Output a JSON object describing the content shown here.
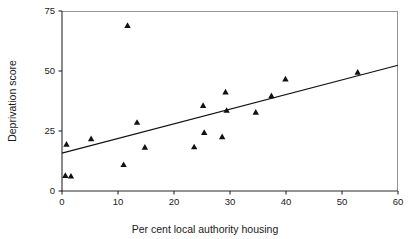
{
  "chart_data": {
    "type": "scatter",
    "title": "",
    "xlabel": "Per cent local authority housing",
    "ylabel": "Deprivation score",
    "xlim": [
      0,
      60
    ],
    "ylim": [
      0,
      75
    ],
    "xticks": [
      0,
      10,
      20,
      30,
      40,
      50,
      60
    ],
    "yticks": [
      0,
      25,
      50,
      75
    ],
    "xtick_labels": [
      "0",
      "10",
      "20",
      "30",
      "40",
      "50",
      "60"
    ],
    "ytick_labels": [
      "0",
      "25",
      "50",
      "75"
    ],
    "grid": false,
    "legend": false,
    "marker": "triangle",
    "marker_color": "#111111",
    "points": [
      {
        "x": 0.8,
        "y": 19.5
      },
      {
        "x": 0.6,
        "y": 6.5
      },
      {
        "x": 1.6,
        "y": 6.2
      },
      {
        "x": 5.2,
        "y": 21.8
      },
      {
        "x": 11.0,
        "y": 11.0
      },
      {
        "x": 11.7,
        "y": 69.0
      },
      {
        "x": 13.4,
        "y": 28.6
      },
      {
        "x": 14.8,
        "y": 18.2
      },
      {
        "x": 23.6,
        "y": 18.4
      },
      {
        "x": 25.2,
        "y": 35.6
      },
      {
        "x": 25.4,
        "y": 24.4
      },
      {
        "x": 28.6,
        "y": 22.6
      },
      {
        "x": 29.2,
        "y": 41.3
      },
      {
        "x": 29.4,
        "y": 33.6
      },
      {
        "x": 34.6,
        "y": 32.8
      },
      {
        "x": 37.4,
        "y": 39.7
      },
      {
        "x": 39.9,
        "y": 46.7
      },
      {
        "x": 52.8,
        "y": 49.5
      }
    ],
    "fit_line": {
      "name": "least-squares regression line",
      "x_start": 0,
      "y_start": 15.8,
      "x_end": 60,
      "y_end": 52.4
    }
  }
}
